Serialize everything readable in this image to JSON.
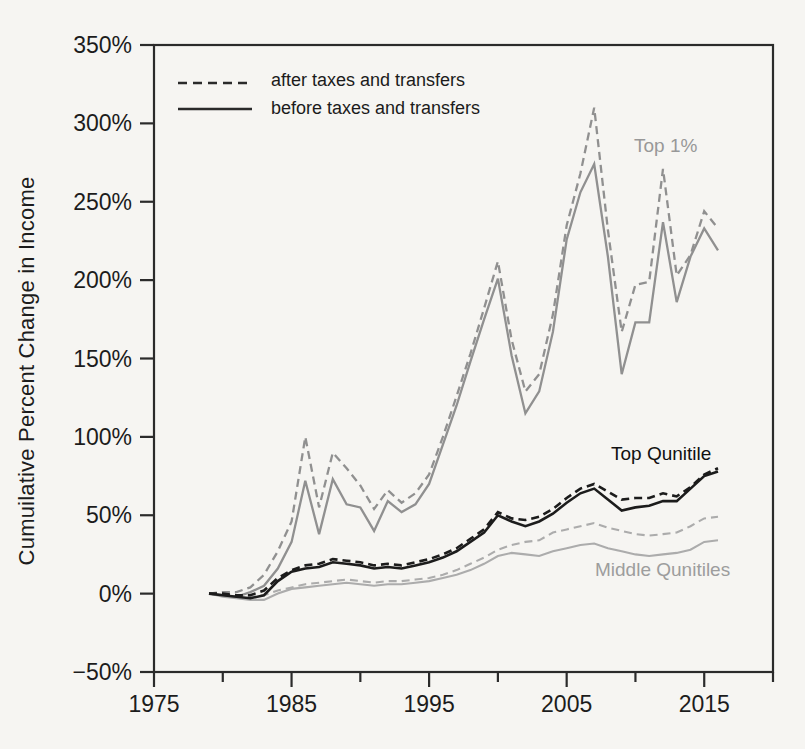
{
  "figure": {
    "y_axis_title": "Cumuilative Percent Change in Income",
    "legend": {
      "after_label": "after taxes and transfers",
      "before_label": "before taxes and transfers"
    },
    "annotations": {
      "top1_label": "Top 1%",
      "top_quintile_label": "Top Qunitile",
      "middle_quintiles_label": "Middle Qunitiles"
    },
    "colors": {
      "top1_line": "#909090",
      "top_quintile_line": "#1c1c1c",
      "middle_line": "#acacac",
      "axis": "#2b2b2b",
      "legend_line": "#2a2a2a",
      "gray_label_text": "#989898",
      "background": "#f6f5f2"
    }
  },
  "chart_data": {
    "type": "line",
    "title": "",
    "xlabel": "",
    "ylabel": "Cumuilative Percent Change in Income",
    "x_range": [
      1975,
      2020
    ],
    "ylim_percent": [
      -50,
      350
    ],
    "grid": "off",
    "legend_position": "top-left-inside",
    "x_major_ticks": [
      1975,
      1985,
      1995,
      2005,
      2015
    ],
    "x_major_tick_labels": [
      "1975",
      "1985",
      "1995",
      "2005",
      "2015"
    ],
    "x_minor_ticks": [
      1980,
      1990,
      2000,
      2010,
      2020
    ],
    "y_ticks_percent": [
      350,
      300,
      250,
      200,
      150,
      100,
      50,
      0,
      -50
    ],
    "y_tick_labels": [
      "350%",
      "300%",
      "250%",
      "200%",
      "150%",
      "100%",
      "50%",
      "0%",
      "−50%"
    ],
    "years": [
      1979,
      1980,
      1981,
      1982,
      1983,
      1984,
      1985,
      1986,
      1987,
      1988,
      1989,
      1990,
      1991,
      1992,
      1993,
      1994,
      1995,
      1996,
      1997,
      1998,
      1999,
      2000,
      2001,
      2002,
      2003,
      2004,
      2005,
      2006,
      2007,
      2008,
      2009,
      2010,
      2011,
      2012,
      2013,
      2014,
      2015,
      2016
    ],
    "series": [
      {
        "name": "Middle Qunitiles — after taxes and transfers",
        "group": "middle",
        "style": "dashed",
        "color": "#acacac",
        "values": [
          0,
          -1,
          -2,
          -2,
          -1,
          2,
          4,
          6,
          7,
          8,
          9,
          8,
          7,
          8,
          8,
          9,
          10,
          12,
          15,
          19,
          23,
          28,
          31,
          33,
          34,
          39,
          41,
          43,
          45,
          42,
          40,
          38,
          37,
          38,
          39,
          43,
          48,
          49
        ]
      },
      {
        "name": "Middle Qunitiles — before taxes and transfers",
        "group": "middle",
        "style": "solid",
        "color": "#acacac",
        "values": [
          0,
          -2,
          -3,
          -4,
          -4,
          0,
          3,
          4,
          5,
          6,
          7,
          6,
          5,
          6,
          6,
          7,
          8,
          10,
          12,
          15,
          19,
          24,
          26,
          25,
          24,
          27,
          29,
          31,
          32,
          29,
          27,
          25,
          24,
          25,
          26,
          28,
          33,
          34
        ]
      },
      {
        "name": "Top 1% — after taxes and transfers",
        "group": "top1",
        "style": "dashed",
        "color": "#909090",
        "values": [
          0,
          1,
          1,
          4,
          12,
          27,
          46,
          100,
          55,
          90,
          80,
          69,
          54,
          66,
          58,
          64,
          76,
          100,
          126,
          153,
          182,
          212,
          162,
          129,
          140,
          178,
          235,
          268,
          310,
          232,
          167,
          197,
          199,
          271,
          203,
          216,
          244,
          233
        ]
      },
      {
        "name": "Top 1% — before taxes and transfers",
        "group": "top1",
        "style": "solid",
        "color": "#909090",
        "values": [
          0,
          -1,
          -2,
          1,
          5,
          16,
          33,
          72,
          38,
          73,
          57,
          55,
          40,
          59,
          52,
          57,
          70,
          95,
          120,
          148,
          175,
          201,
          152,
          115,
          129,
          167,
          226,
          256,
          274,
          215,
          140,
          173,
          173,
          237,
          186,
          215,
          233,
          219
        ]
      },
      {
        "name": "Top Qunitile — after taxes and transfers",
        "group": "top_quintile",
        "style": "dashed",
        "color": "#1c1c1c",
        "values": [
          0,
          0,
          -1,
          -1,
          2,
          10,
          15,
          18,
          19,
          22,
          21,
          20,
          18,
          19,
          18,
          20,
          22,
          25,
          29,
          35,
          41,
          52,
          48,
          47,
          49,
          54,
          61,
          67,
          70,
          65,
          60,
          61,
          61,
          64,
          62,
          68,
          76,
          80
        ]
      },
      {
        "name": "Top Qunitile — before taxes and transfers",
        "group": "top_quintile",
        "style": "solid",
        "color": "#1c1c1c",
        "values": [
          0,
          -1,
          -2,
          -3,
          -1,
          8,
          14,
          16,
          17,
          20,
          19,
          18,
          16,
          17,
          16,
          18,
          20,
          23,
          27,
          33,
          39,
          50,
          46,
          43,
          46,
          51,
          58,
          64,
          67,
          60,
          53,
          55,
          56,
          59,
          59,
          67,
          75,
          78
        ]
      }
    ]
  }
}
